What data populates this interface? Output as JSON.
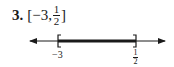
{
  "problem": {
    "number": "3.",
    "interval_open": "[",
    "left_value": "−3,",
    "right_numerator": "1",
    "right_denominator": "2",
    "interval_close": "]"
  },
  "number_line": {
    "left_endpoint_label": "−3",
    "right_endpoint_numerator": "1",
    "right_endpoint_denominator": "2",
    "left_bracket": "closed",
    "right_bracket": "closed",
    "color": "#1a1a1a"
  }
}
